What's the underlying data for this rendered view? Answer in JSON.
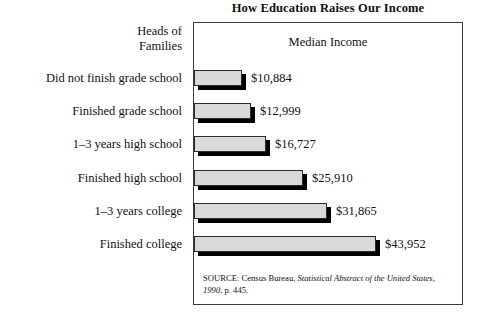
{
  "chart_data": {
    "type": "bar",
    "orientation": "horizontal",
    "title": "How Education Raises Our Income",
    "row_header": {
      "line1": "Heads of",
      "line2": "Families"
    },
    "value_axis_header": "Median Income",
    "xlabel": "",
    "ylabel": "",
    "categories": [
      "Did not finish grade school",
      "Finished grade school",
      "1–3 years high school",
      "Finished high school",
      "1–3 years college",
      "Finished college"
    ],
    "values": [
      10884,
      12999,
      16727,
      25910,
      31865,
      43952
    ],
    "value_labels": [
      "$10,884",
      "$12,999",
      "$16,727",
      "$25,910",
      "$31,865",
      "$43,952"
    ],
    "xlim": [
      0,
      48000
    ],
    "grid": false,
    "legend": null,
    "bar_fill_color": "#d9d9d9",
    "bar_edge_color": "#2b2b2b",
    "bar_shadow_color": "#000000",
    "panel_border_color": "#3a3a3a",
    "source_note": {
      "prefix": "SOURCE: Census Bureau, ",
      "italic": "Statistical Abstract of the United States, 1990",
      "suffix": ", p. 445."
    }
  }
}
